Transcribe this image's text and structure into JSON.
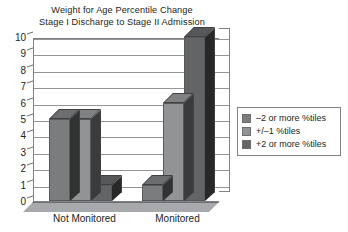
{
  "chart_data": {
    "type": "bar",
    "title": "Weight for Age Percentile Change",
    "subtitle": "Stage I Discharge to Stage II Admission",
    "title_lines": [
      "Weight for Age Percentile Change",
      "Stage I Discharge to Stage II Admission"
    ],
    "xlabel": "",
    "ylabel": "",
    "categories": [
      "Not Monitored",
      "Monitored"
    ],
    "ylim": [
      0,
      10
    ],
    "yticks": [
      0,
      1,
      2,
      3,
      4,
      5,
      6,
      7,
      8,
      9,
      10
    ],
    "ytick_labels": [
      "0",
      "1",
      "2",
      "3",
      "4",
      "5",
      "6",
      "7",
      "8",
      "9",
      "10"
    ],
    "grid": true,
    "grid_axis": "y",
    "legend_position": "right",
    "style": "3d-column",
    "series": [
      {
        "name": "–2 or more %tiles",
        "values": [
          5,
          1
        ],
        "color": "#7a7c7e"
      },
      {
        "name": "+/–1 %tiles",
        "values": [
          5,
          6
        ],
        "color": "#919395"
      },
      {
        "name": "+2 or more %tiles",
        "values": [
          1,
          10
        ],
        "color": "#636466"
      }
    ]
  },
  "legend": {
    "items": [
      {
        "label": "–2 or more %tiles",
        "color": "#7a7c7e"
      },
      {
        "label": "+/–1 %tiles",
        "color": "#919395"
      },
      {
        "label": "+2 or more %tiles",
        "color": "#636466"
      }
    ]
  },
  "colors": {
    "axis": "#808285",
    "gridline": "#939598",
    "text": "#231f20",
    "floor": "#a7a9ac",
    "background": "#ffffff"
  }
}
